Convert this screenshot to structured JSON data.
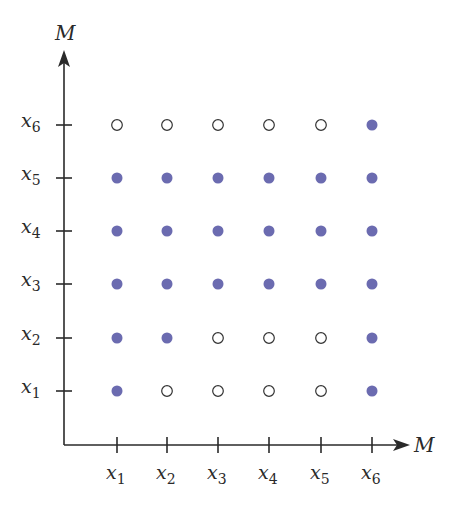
{
  "diagram": {
    "y_axis_label": "M",
    "x_axis_label": "M",
    "x_ticks": [
      {
        "base": "x",
        "sub": "1"
      },
      {
        "base": "x",
        "sub": "2"
      },
      {
        "base": "x",
        "sub": "3"
      },
      {
        "base": "x",
        "sub": "4"
      },
      {
        "base": "x",
        "sub": "5"
      },
      {
        "base": "x",
        "sub": "6"
      }
    ],
    "y_ticks": [
      {
        "base": "x",
        "sub": "1"
      },
      {
        "base": "x",
        "sub": "2"
      },
      {
        "base": "x",
        "sub": "3"
      },
      {
        "base": "x",
        "sub": "4"
      },
      {
        "base": "x",
        "sub": "5"
      },
      {
        "base": "x",
        "sub": "6"
      }
    ],
    "filled_color": "#6b6bb0",
    "open_stroke_color": "#333333",
    "grid_rows_bottom_to_top": [
      [
        1,
        0,
        0,
        0,
        0,
        1
      ],
      [
        1,
        1,
        0,
        0,
        0,
        1
      ],
      [
        1,
        1,
        1,
        1,
        1,
        1
      ],
      [
        1,
        1,
        1,
        1,
        1,
        1
      ],
      [
        1,
        1,
        1,
        1,
        1,
        1
      ],
      [
        0,
        0,
        0,
        0,
        0,
        1
      ]
    ],
    "legend": {
      "filled": "pair in relation",
      "open": "pair not in relation"
    }
  },
  "chart_data": {
    "type": "scatter",
    "title": "",
    "xlabel": "M",
    "ylabel": "M",
    "x_categories": [
      "x1",
      "x2",
      "x3",
      "x4",
      "x5",
      "x6"
    ],
    "y_categories": [
      "x1",
      "x2",
      "x3",
      "x4",
      "x5",
      "x6"
    ],
    "filled_points": [
      [
        "x1",
        "x1"
      ],
      [
        "x6",
        "x1"
      ],
      [
        "x1",
        "x2"
      ],
      [
        "x2",
        "x2"
      ],
      [
        "x6",
        "x2"
      ],
      [
        "x1",
        "x3"
      ],
      [
        "x2",
        "x3"
      ],
      [
        "x3",
        "x3"
      ],
      [
        "x4",
        "x3"
      ],
      [
        "x5",
        "x3"
      ],
      [
        "x6",
        "x3"
      ],
      [
        "x1",
        "x4"
      ],
      [
        "x2",
        "x4"
      ],
      [
        "x3",
        "x4"
      ],
      [
        "x4",
        "x4"
      ],
      [
        "x5",
        "x4"
      ],
      [
        "x6",
        "x4"
      ],
      [
        "x1",
        "x5"
      ],
      [
        "x2",
        "x5"
      ],
      [
        "x3",
        "x5"
      ],
      [
        "x4",
        "x5"
      ],
      [
        "x5",
        "x5"
      ],
      [
        "x6",
        "x5"
      ],
      [
        "x6",
        "x6"
      ]
    ],
    "open_points": [
      [
        "x2",
        "x1"
      ],
      [
        "x3",
        "x1"
      ],
      [
        "x4",
        "x1"
      ],
      [
        "x5",
        "x1"
      ],
      [
        "x3",
        "x2"
      ],
      [
        "x4",
        "x2"
      ],
      [
        "x5",
        "x2"
      ],
      [
        "x1",
        "x6"
      ],
      [
        "x2",
        "x6"
      ],
      [
        "x3",
        "x6"
      ],
      [
        "x4",
        "x6"
      ],
      [
        "x5",
        "x6"
      ]
    ],
    "grid": false
  }
}
